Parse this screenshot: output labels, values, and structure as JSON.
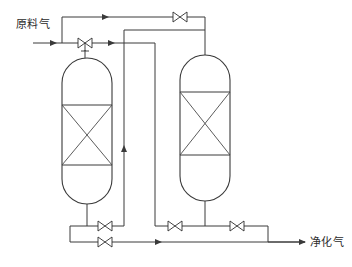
{
  "diagram": {
    "type": "process-flow-diagram",
    "title": "",
    "background_color": "#ffffff",
    "line_color": "#3a3a3a",
    "labels": {
      "feed_gas": "原料气",
      "purified_gas": "净化气"
    },
    "vessels": [
      {
        "id": "adsorber-left",
        "name": "left-adsorber-vessel",
        "shape": "capsule",
        "bed_pattern": "x-cross",
        "x": 62,
        "y": 58,
        "width": 50,
        "height": 146,
        "bed_top": 105,
        "bed_bottom": 165
      },
      {
        "id": "adsorber-right",
        "name": "right-adsorber-vessel",
        "shape": "capsule",
        "bed_pattern": "x-cross",
        "x": 180,
        "y": 55,
        "width": 50,
        "height": 146,
        "bed_top": 92,
        "bed_bottom": 155
      }
    ],
    "valves": [
      {
        "id": "v-top-right",
        "name": "valve-top-crossover",
        "x": 180,
        "y": 17,
        "orientation": "horizontal",
        "stem": false
      },
      {
        "id": "v-feed",
        "name": "valve-feed-inlet",
        "x": 85,
        "y": 43,
        "orientation": "horizontal",
        "stem": true
      },
      {
        "id": "v-left-upper",
        "name": "valve-left-bottom-upper",
        "x": 105,
        "y": 226,
        "orientation": "horizontal",
        "stem": false
      },
      {
        "id": "v-left-lower",
        "name": "valve-left-bottom-lower",
        "x": 105,
        "y": 242,
        "orientation": "horizontal",
        "stem": false
      },
      {
        "id": "v-mid-bottom",
        "name": "valve-middle-bottom",
        "x": 175,
        "y": 226,
        "orientation": "horizontal",
        "stem": false
      },
      {
        "id": "v-right-bottom",
        "name": "valve-right-bottom-outlet",
        "x": 237,
        "y": 226,
        "orientation": "horizontal",
        "stem": false
      }
    ],
    "flow_arrows": [
      {
        "name": "arrow-feed-inlet",
        "x": 55,
        "y": 43,
        "direction": "right"
      },
      {
        "name": "arrow-top-bypass",
        "x": 107,
        "y": 17,
        "direction": "right"
      },
      {
        "name": "arrow-feed-to-riser",
        "x": 113,
        "y": 43,
        "direction": "right"
      },
      {
        "name": "arrow-riser-up",
        "x": 124,
        "y": 145,
        "direction": "up"
      },
      {
        "name": "arrow-bottom-outlet",
        "x": 160,
        "y": 242,
        "direction": "right"
      },
      {
        "name": "arrow-purified-out",
        "x": 300,
        "y": 242,
        "direction": "right"
      }
    ]
  }
}
